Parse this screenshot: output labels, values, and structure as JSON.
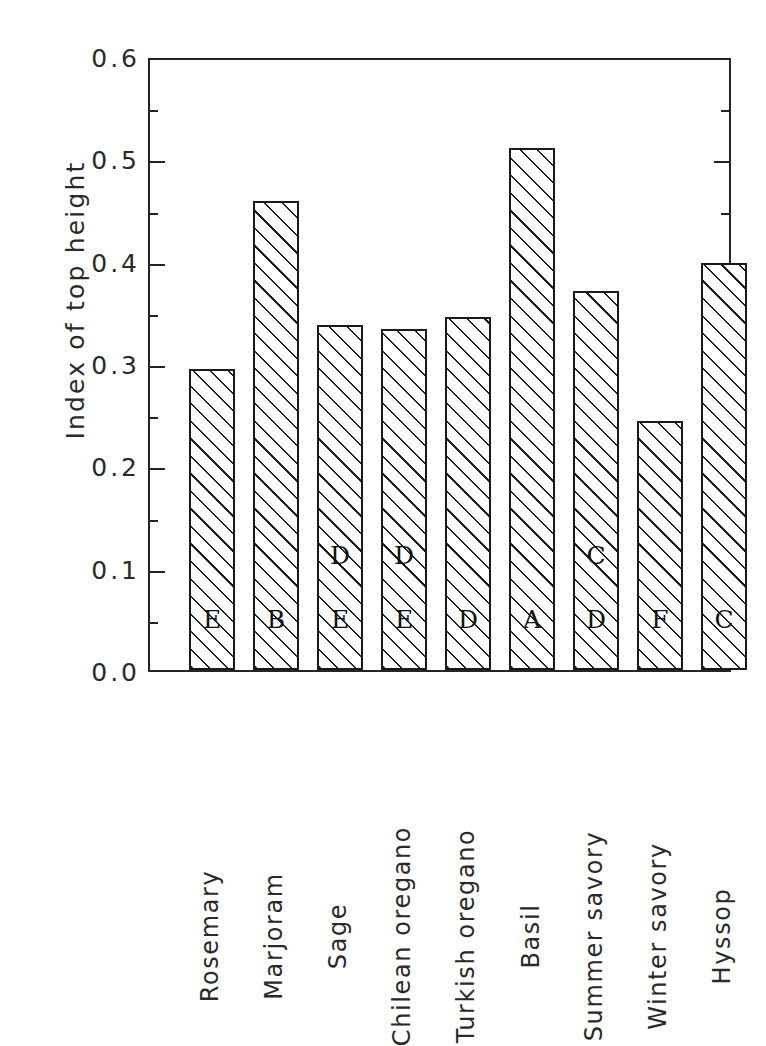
{
  "chart": {
    "type": "bar",
    "title": "",
    "xlabel": "",
    "ylabel": "Index of top height",
    "ylim": [
      0.0,
      0.6
    ],
    "ytick_labels": [
      "0.6",
      "0.5",
      "0.4",
      "0.3",
      "0.2",
      "0.1",
      "0.0"
    ],
    "ytick_values": [
      0.6,
      0.5,
      0.4,
      0.3,
      0.2,
      0.1,
      0.0
    ],
    "minor_ticks": [
      0.55,
      0.45,
      0.35,
      0.25,
      0.15,
      0.05
    ],
    "grid": false,
    "legend": null,
    "frame": "box",
    "tick_direction": "in",
    "bar_fill": "diagonal-hatch",
    "bar_edge_color": "#1a1a1a",
    "categories": [
      "Rosemary",
      "Marjoram",
      "Sage",
      "Chilean oregano",
      "Turkish oregano",
      "Basil",
      "Summer savory",
      "Winter savory",
      "Hyssop"
    ],
    "values": [
      0.294,
      0.458,
      0.337,
      0.333,
      0.345,
      0.51,
      0.37,
      0.243,
      0.398
    ],
    "group_letters_low": [
      "E",
      "B",
      "E",
      "E",
      "D",
      "A",
      "D",
      "F",
      "C"
    ],
    "group_letters_high": [
      "",
      "",
      "D",
      "D",
      "",
      "",
      "C",
      "",
      ""
    ]
  }
}
